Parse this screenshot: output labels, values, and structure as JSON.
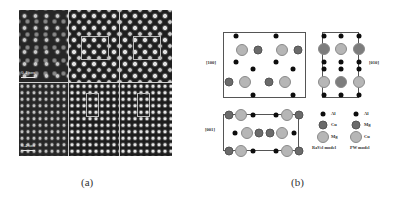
{
  "figure": {
    "panel_a": {
      "caption": "(a)",
      "scale_bars": [
        {
          "label": "0.4 nm",
          "position": "top-left panel"
        },
        {
          "label": "0.4 nm",
          "position": "bottom-left panel"
        }
      ],
      "rows": [
        {
          "row": "top",
          "panels": [
            "experimental HRTEM",
            "simulated (box highlighted)",
            "simulated (box highlighted)"
          ]
        },
        {
          "row": "bottom",
          "panels": [
            "experimental HRTEM",
            "simulated (box highlighted)",
            "simulated (box highlighted)"
          ]
        }
      ]
    },
    "panel_b": {
      "caption": "(b)",
      "views": [
        {
          "label": "[100]"
        },
        {
          "label": "[010]"
        },
        {
          "label": "[001]"
        }
      ],
      "legend": {
        "ravel": {
          "title": "RaVel model",
          "items": [
            {
              "symbol": "small-black",
              "label": "Al"
            },
            {
              "symbol": "medium-dark-gray",
              "label": "Cu"
            },
            {
              "symbol": "large-light-gray",
              "label": "Mg"
            }
          ]
        },
        "pw": {
          "title": "PW model",
          "items": [
            {
              "symbol": "small-black",
              "label": "Al"
            },
            {
              "symbol": "medium-dark-gray",
              "label": "Mg"
            },
            {
              "symbol": "large-light-gray",
              "label": "Cu"
            }
          ]
        }
      }
    }
  }
}
